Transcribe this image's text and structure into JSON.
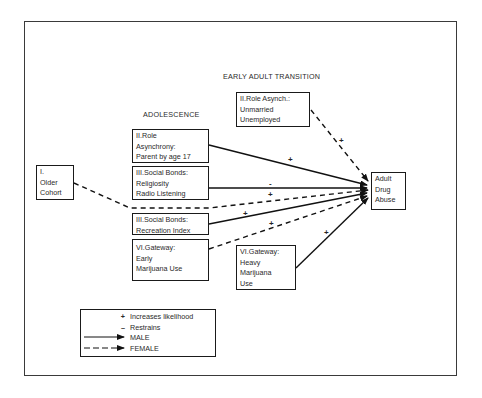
{
  "diagram": {
    "headings": {
      "early_adult": "EARLY ADULT TRANSITION",
      "adolescence": "ADOLESCENCE"
    },
    "nodes": {
      "older_cohort": {
        "lines": [
          "I.",
          "Older",
          "Cohort"
        ]
      },
      "role_asynchrony": {
        "lines": [
          "II.Role",
          "Asynchrony:",
          "Parent by age 17"
        ]
      },
      "social_bonds_religiosity": {
        "lines": [
          "III.Social Bonds:",
          "Religiosity",
          "Radio Listening"
        ]
      },
      "social_bonds_recreation": {
        "lines": [
          "III.Social Bonds:",
          "Recreation Index"
        ]
      },
      "gateway_early": {
        "lines": [
          "VI.Gateway:",
          "Early",
          "Marijuana  Use"
        ]
      },
      "role_asynch_adult": {
        "lines": [
          "II.Role Asynch.:",
          "Unmarried",
          "Unemployed"
        ]
      },
      "gateway_heavy": {
        "lines": [
          "VI.Gateway:",
          "Heavy",
          "Marijuana",
          "Use"
        ]
      },
      "adult_drug_abuse": {
        "lines": [
          "Adult",
          "Drug",
          "Abuse"
        ]
      }
    },
    "edges": [
      {
        "from": "role_asynch_adult",
        "to": "adult_drug_abuse",
        "style": "dashed",
        "sign": "+"
      },
      {
        "from": "role_asynchrony",
        "to": "adult_drug_abuse",
        "style": "solid",
        "sign": "+"
      },
      {
        "from": "social_bonds_religiosity",
        "to": "adult_drug_abuse",
        "style": "solid",
        "sign": "-"
      },
      {
        "from": "older_cohort",
        "to": "adult_drug_abuse",
        "style": "dashed",
        "sign": "+"
      },
      {
        "from": "social_bonds_recreation",
        "to": "adult_drug_abuse",
        "style": "solid",
        "sign": "+"
      },
      {
        "from": "gateway_early",
        "to": "adult_drug_abuse",
        "style": "dashed",
        "sign": "+"
      },
      {
        "from": "gateway_heavy",
        "to": "adult_drug_abuse",
        "style": "solid",
        "sign": "+"
      }
    ],
    "signs": {
      "role_asynch_adult": "+",
      "role_asynchrony": "+",
      "religiosity": "-",
      "older_cohort": "+",
      "recreation": "+",
      "gateway_early": "+",
      "gateway_heavy": "+"
    },
    "legend": {
      "rows": [
        {
          "symbol": "+",
          "label": "Increases likelihood"
        },
        {
          "symbol": "–",
          "label": "Restrains"
        },
        {
          "symbol": "",
          "label": "MALE"
        },
        {
          "symbol": "",
          "label": "FEMALE"
        }
      ]
    }
  }
}
